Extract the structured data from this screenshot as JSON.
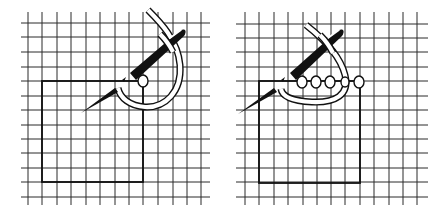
{
  "figure": {
    "panels": [
      {
        "id": "step-1",
        "grid": {
          "x0": 21,
          "x1": 210,
          "y_top": 12,
          "y_bottom": 205,
          "vlines": [
            28,
            42,
            57,
            71,
            86,
            100,
            115,
            129,
            143,
            158,
            173,
            187,
            201
          ],
          "hlines": [
            23,
            37,
            52,
            67,
            81,
            96,
            110,
            125,
            139,
            153,
            168,
            182,
            197
          ]
        },
        "square": {
          "x": 42,
          "y": 81,
          "w": 101,
          "h": 101
        },
        "stitch_count": 1
      },
      {
        "id": "step-2",
        "grid": {
          "x0": 236,
          "x1": 428,
          "y_top": 12,
          "y_bottom": 205,
          "vlines": [
            245,
            259,
            274,
            288,
            303,
            317,
            331,
            345,
            360,
            374,
            389,
            403,
            417
          ],
          "hlines": [
            24,
            38,
            52,
            67,
            81,
            96,
            110,
            125,
            139,
            153,
            168,
            182,
            197
          ]
        },
        "square": {
          "x": 259,
          "y": 81,
          "w": 101,
          "h": 102
        },
        "stitch_count": 5
      }
    ],
    "colors": {
      "ink": "#111111",
      "paper": "#ffffff",
      "grid": "#2a2a2a"
    }
  }
}
